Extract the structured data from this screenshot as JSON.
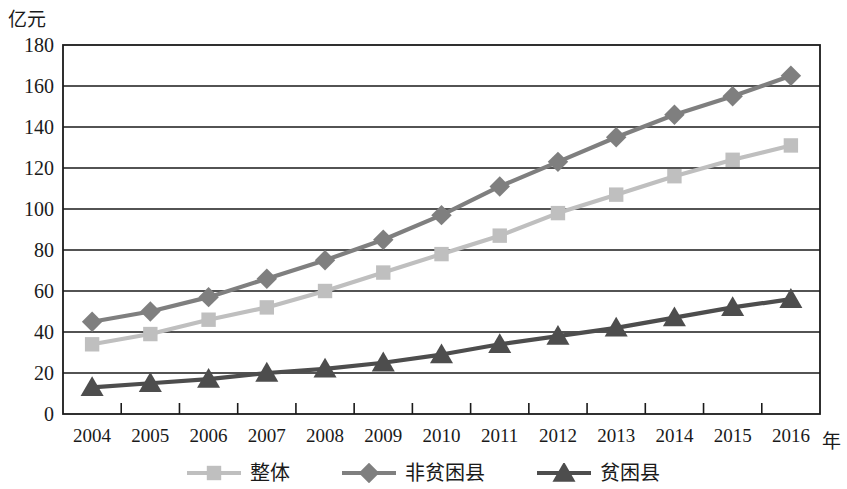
{
  "chart_data": {
    "type": "line",
    "title": "",
    "subtitle": "",
    "xlabel": "年",
    "ylabel": "亿元",
    "x": [
      2004,
      2005,
      2006,
      2007,
      2008,
      2009,
      2010,
      2011,
      2012,
      2013,
      2014,
      2015,
      2016
    ],
    "categories": [
      "2004",
      "2005",
      "2006",
      "2007",
      "2008",
      "2009",
      "2010",
      "2011",
      "2012",
      "2013",
      "2014",
      "2015",
      "2016"
    ],
    "xtick_labels": [
      "2004",
      "2005",
      "2006",
      "2007",
      "2008",
      "2009",
      "2010",
      "2011",
      "2012",
      "2013",
      "2014",
      "2015",
      "2016"
    ],
    "ytick_labels": [
      "0",
      "20",
      "40",
      "60",
      "80",
      "100",
      "120",
      "140",
      "160",
      "180"
    ],
    "yticks": [
      0,
      20,
      40,
      60,
      80,
      100,
      120,
      140,
      160,
      180
    ],
    "ylim": [
      0,
      180
    ],
    "grid": "horizontal",
    "legend_position": "bottom",
    "series": [
      {
        "name": "整体",
        "marker": "square",
        "color": "#bfbfbf",
        "values": [
          34,
          39,
          46,
          52,
          60,
          69,
          78,
          87,
          98,
          107,
          116,
          124,
          131
        ]
      },
      {
        "name": "非贫困县",
        "marker": "diamond",
        "color": "#7f7f7f",
        "values": [
          45,
          50,
          57,
          66,
          75,
          85,
          97,
          111,
          123,
          135,
          146,
          155,
          165
        ]
      },
      {
        "name": "贫困县",
        "marker": "triangle",
        "color": "#4d4d4d",
        "values": [
          13,
          15,
          17,
          20,
          22,
          25,
          29,
          34,
          38,
          42,
          47,
          52,
          56
        ]
      }
    ]
  },
  "legend": {
    "items": [
      {
        "label": "整体"
      },
      {
        "label": "非贫困县"
      },
      {
        "label": "贫困县"
      }
    ]
  },
  "axes": {
    "y_unit": "亿元",
    "x_unit": "年"
  },
  "colors": {
    "axis": "#1a1a1a",
    "grid": "#1a1a1a",
    "background": "#ffffff"
  }
}
